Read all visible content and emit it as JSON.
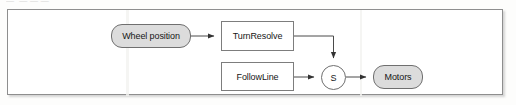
{
  "page": {
    "heading_remnant": "—  — — —"
  },
  "figure": {
    "frame_border_color": "#8e8e8e",
    "background_color": "#ffffff"
  },
  "diagram": {
    "type": "block-diagram",
    "nodes": [
      {
        "id": "wheel-position",
        "label": "Wheel position",
        "shape": "rounded-rectangle",
        "fill": "#dcdcdc"
      },
      {
        "id": "turn-resolve",
        "label": "TurnResolve",
        "shape": "rectangle",
        "fill": "#ffffff"
      },
      {
        "id": "follow-line",
        "label": "FollowLine",
        "shape": "rectangle",
        "fill": "#ffffff"
      },
      {
        "id": "sum",
        "label": "S",
        "shape": "circle",
        "fill": "#ffffff"
      },
      {
        "id": "motors",
        "label": "Motors",
        "shape": "rounded-rectangle",
        "fill": "#dcdcdc"
      }
    ],
    "edges": [
      {
        "from": "wheel-position",
        "to": "turn-resolve",
        "style": "straight-arrow"
      },
      {
        "from": "turn-resolve",
        "to": "sum",
        "style": "elbow-arrow-into-top"
      },
      {
        "from": "follow-line",
        "to": "sum",
        "style": "straight-arrow"
      },
      {
        "from": "sum",
        "to": "motors",
        "style": "straight-arrow"
      }
    ],
    "line_color": "#4a4a4a"
  }
}
